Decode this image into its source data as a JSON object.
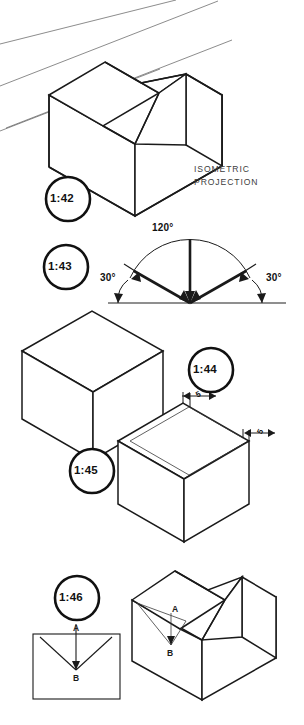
{
  "page": {
    "background": "#ffffff",
    "ink": "#1a1a1a"
  },
  "figures": [
    {
      "id": "1:42",
      "tag": "1:42",
      "caption_line1": "ISOMETRIC",
      "caption_line2": "PROJECTION",
      "description": "V-block drawn in isometric projection with background guide lines"
    },
    {
      "id": "1:43",
      "tag": "1:43",
      "description": "Isometric axes construction with angle dimensions",
      "angles": {
        "top": "120°",
        "left": "30°",
        "right": "30°"
      }
    },
    {
      "id": "1:44",
      "tag": "1:44",
      "description": "Plain cube drawn in isometric projection"
    },
    {
      "id": "1:45",
      "tag": "1:45",
      "description": "Box in isometric projection with inset top face border",
      "dimensions": [
        {
          "value": "5",
          "edge": "top-left"
        },
        {
          "value": "5",
          "edge": "top-right"
        }
      ]
    },
    {
      "id": "1:46",
      "tag": "1:46",
      "description": "V-block shown as front orthographic view and isometric view with points A and B",
      "points": {
        "front_view": [
          {
            "label": "A",
            "position": "top-middle"
          },
          {
            "label": "B",
            "position": "groove-vertex"
          }
        ],
        "iso_view": [
          {
            "label": "A",
            "position": "top-middle"
          },
          {
            "label": "B",
            "position": "groove-vertex"
          }
        ]
      }
    }
  ],
  "labels": {
    "a": "A",
    "b": "B"
  }
}
